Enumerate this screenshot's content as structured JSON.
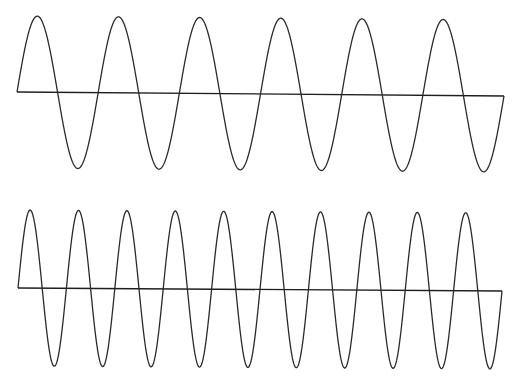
{
  "diagram": {
    "colors": {
      "background": "#ffffff",
      "stroke": "#2a2a2a"
    },
    "waves": [
      {
        "name": "lower-frequency-wave",
        "cycles": 6,
        "x_start": 17,
        "x_end": 504,
        "baseline_y_start": 92,
        "baseline_y_end": 96,
        "amplitude": 76
      },
      {
        "name": "higher-frequency-wave",
        "cycles": 10,
        "x_start": 18,
        "x_end": 502,
        "baseline_y_start": 288,
        "baseline_y_end": 291,
        "amplitude": 78
      }
    ]
  }
}
